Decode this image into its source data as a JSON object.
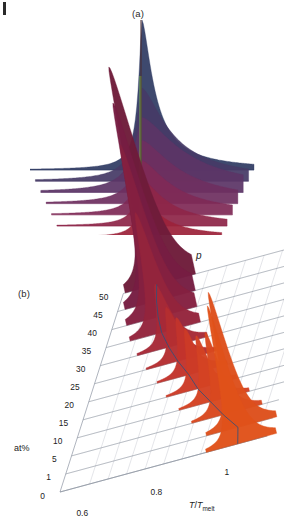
{
  "figure": {
    "panels": [
      {
        "id": "a",
        "label": "(a)",
        "type": "ridgeline-waterfall"
      },
      {
        "id": "b",
        "label": "(b)",
        "type": "3d-waterfall"
      }
    ]
  },
  "panel_a": {
    "label": "(a)",
    "peak_trace_color": "#7cc24a",
    "colormap_top": "#2f3b63",
    "colormap_bottom": "#b51d10",
    "n_curves": 12
  },
  "panel_b": {
    "label": "(b)",
    "z_axis_label": "p",
    "x_axis_label_num": "T",
    "x_axis_label_den": "T",
    "x_axis_label_sub": "melt",
    "depth_axis_label": "at%",
    "x_ticks": [
      "0.6",
      "0.8",
      "1"
    ],
    "depth_ticks": [
      "50",
      "45",
      "40",
      "35",
      "30",
      "25",
      "20",
      "15",
      "10",
      "5",
      "1",
      "0"
    ],
    "peak_path_color": "#2f4f7a",
    "grid_color": "#8f96a3",
    "peak_color_front": "#e0521a",
    "peak_color_back": "#6e1c3a"
  },
  "chart_data": {
    "type": "area",
    "title": "",
    "subtitle": "",
    "xlabel": "T/Tmelt",
    "ylabel": "p",
    "zlabel": "at%",
    "xlim": [
      0.52,
      1.08
    ],
    "grid": true,
    "legend": "none",
    "panel_a": {
      "type": "area",
      "description": "Ridgeline stack of probability density p versus T/Tmelt for increasing solute concentration; curves offset vertically, colored dark blue (low at%) through purple to red (high at%); a green vertical line marks the melting point reference.",
      "categories": [
        "0",
        "1",
        "5",
        "10",
        "15",
        "20",
        "25",
        "30",
        "35",
        "40",
        "45",
        "50"
      ],
      "series": [
        {
          "name": "0",
          "peak_x": 1.0,
          "peak_height": 1.0,
          "width": 0.03,
          "color": "#2f3b63",
          "skew": 1.8
        },
        {
          "name": "1",
          "peak_x": 0.995,
          "peak_height": 0.62,
          "width": 0.055,
          "color": "#463a66",
          "skew": 2.2
        },
        {
          "name": "5",
          "peak_x": 0.99,
          "peak_height": 0.5,
          "width": 0.07,
          "color": "#5b3566",
          "skew": 2.6
        },
        {
          "name": "10",
          "peak_x": 0.985,
          "peak_height": 0.42,
          "width": 0.062,
          "color": "#6e2f60",
          "skew": 2.6
        },
        {
          "name": "15",
          "peak_x": 0.98,
          "peak_height": 0.36,
          "width": 0.055,
          "color": "#7f2a56",
          "skew": 2.4
        },
        {
          "name": "20",
          "peak_x": 0.975,
          "peak_height": 0.31,
          "width": 0.048,
          "color": "#8e2648",
          "skew": 2.2
        },
        {
          "name": "25",
          "peak_x": 0.97,
          "peak_height": 0.26,
          "width": 0.042,
          "color": "#9c223a",
          "skew": 2.0
        },
        {
          "name": "30",
          "peak_x": 0.965,
          "peak_height": 0.21,
          "width": 0.036,
          "color": "#a81f2c",
          "skew": 1.8
        },
        {
          "name": "35",
          "peak_x": 0.96,
          "peak_height": 0.16,
          "width": 0.03,
          "color": "#b01d20",
          "skew": 1.6
        },
        {
          "name": "40",
          "peak_x": 0.955,
          "peak_height": 0.12,
          "width": 0.026,
          "color": "#b51d16",
          "skew": 1.5
        },
        {
          "name": "45",
          "peak_x": 0.95,
          "peak_height": 0.085,
          "width": 0.022,
          "color": "#b81d12",
          "skew": 1.4
        },
        {
          "name": "50",
          "peak_x": 0.945,
          "peak_height": 0.055,
          "width": 0.018,
          "color": "#ba1d10",
          "skew": 1.3
        }
      ]
    },
    "panel_b": {
      "type": "area",
      "description": "3D waterfall: probability density p of the order parameter versus reduced temperature T/Tmelt, one ridge per solute concentration at%. Peaks shift to lower T/Tmelt and grow taller as at% increases.",
      "categories": [
        "0",
        "1",
        "5",
        "10",
        "15",
        "20",
        "25",
        "30",
        "35",
        "40",
        "45",
        "50"
      ],
      "x": [
        0.6,
        0.8,
        1.0
      ],
      "series": [
        {
          "name": "0",
          "at_pct": 0,
          "peak_x": 1.0,
          "peak_height": 0.92,
          "color": "#e0521a"
        },
        {
          "name": "1",
          "at_pct": 1,
          "peak_x": 0.985,
          "peak_height": 0.9,
          "color": "#dd4f1c"
        },
        {
          "name": "5",
          "at_pct": 5,
          "peak_x": 0.93,
          "peak_height": 0.55,
          "color": "#d9481f"
        },
        {
          "name": "10",
          "at_pct": 10,
          "peak_x": 0.88,
          "peak_height": 0.44,
          "color": "#d44223"
        },
        {
          "name": "15",
          "at_pct": 15,
          "peak_x": 0.83,
          "peak_height": 0.4,
          "color": "#cc3b27"
        },
        {
          "name": "20",
          "at_pct": 20,
          "peak_x": 0.79,
          "peak_height": 0.38,
          "color": "#c2342c"
        },
        {
          "name": "25",
          "at_pct": 25,
          "peak_x": 0.745,
          "peak_height": 0.36,
          "color": "#b52e31"
        },
        {
          "name": "30",
          "at_pct": 30,
          "peak_x": 0.705,
          "peak_height": 0.42,
          "color": "#a62937"
        },
        {
          "name": "35",
          "at_pct": 35,
          "peak_x": 0.67,
          "peak_height": 0.8,
          "color": "#94243c"
        },
        {
          "name": "40",
          "at_pct": 40,
          "peak_x": 0.645,
          "peak_height": 1.15,
          "color": "#842040"
        },
        {
          "name": "45",
          "at_pct": 45,
          "peak_x": 0.625,
          "peak_height": 1.32,
          "color": "#761d42"
        },
        {
          "name": "50",
          "at_pct": 50,
          "peak_x": 0.61,
          "peak_height": 1.45,
          "color": "#6e1c3a"
        }
      ]
    }
  }
}
